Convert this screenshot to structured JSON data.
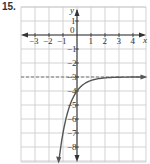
{
  "problem": {
    "number": "15."
  },
  "chart_data": {
    "type": "line",
    "title": "",
    "xlabel": "x",
    "ylabel": "y",
    "xlim": [
      -4,
      4.9
    ],
    "ylim": [
      -9,
      2
    ],
    "grid": true,
    "x_ticks": [
      "-3",
      "-2",
      "-1",
      "0",
      "1",
      "2",
      "3",
      "4"
    ],
    "y_ticks": [
      "1",
      "-1",
      "-2",
      "-3",
      "-4",
      "-5",
      "-6",
      "-7",
      "-8"
    ],
    "asymptote": {
      "type": "horizontal",
      "y": -3,
      "style": "dashed"
    },
    "series": [
      {
        "name": "f(x)",
        "equation_estimate": "y = -3 - 4^(-x)",
        "points": [
          {
            "x": -1.3,
            "y": -9.1
          },
          {
            "x": -1.0,
            "y": -7
          },
          {
            "x": -0.5,
            "y": -5
          },
          {
            "x": 0,
            "y": -4
          },
          {
            "x": 0.5,
            "y": -3.5
          },
          {
            "x": 1,
            "y": -3.25
          },
          {
            "x": 2,
            "y": -3.06
          },
          {
            "x": 3,
            "y": -3.02
          },
          {
            "x": 4.8,
            "y": -3.0
          }
        ]
      }
    ],
    "colors": {
      "curve": "#555555",
      "grid": "#c8c8c8",
      "axis": "#333333",
      "asymptote": "#777777"
    }
  }
}
